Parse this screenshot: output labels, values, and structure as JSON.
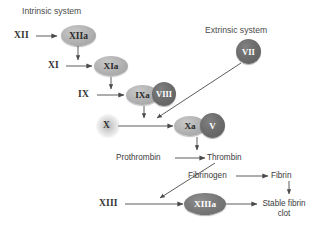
{
  "diagram": {
    "title_intrinsic": "Intrinsic system",
    "title_extrinsic": "Extrinsic system",
    "colors": {
      "node_light": "#b4b4b4",
      "node_dark": "#6d6d6d",
      "node_mid": "#7a7a7a",
      "text": "#3b3b3b",
      "arrow": "#4a4a4a",
      "background": "#ffffff"
    }
  },
  "factors": {
    "xii": "XII",
    "xiia": "XIIa",
    "xi": "XI",
    "xia": "XIa",
    "ix": "IX",
    "ixa": "IXa",
    "viii": "VIII",
    "x": "X",
    "xa": "Xa",
    "v": "V",
    "vii": "VII",
    "xiii": "XIII",
    "xiiia": "XIIIa"
  },
  "proteins": {
    "prothrombin": "Prothrombin",
    "thrombin": "Thrombin",
    "fibrinogen": "Fibrinogen",
    "fibrin": "Fibrin",
    "stable_fibrin_clot_line1": "Stable fibrin",
    "stable_fibrin_clot_line2": "clot"
  },
  "edges": [
    {
      "name": "xii-to-xiia",
      "from": "XII",
      "to": "XIIa",
      "style": "straight-horizontal"
    },
    {
      "name": "xiia-to-xi",
      "from": "XIIa",
      "to": "XI",
      "style": "vertical-down"
    },
    {
      "name": "xi-to-xia",
      "from": "XI",
      "to": "XIa",
      "style": "straight-horizontal"
    },
    {
      "name": "xia-to-ix",
      "from": "XIa",
      "to": "IX",
      "style": "vertical-down"
    },
    {
      "name": "ix-to-ixa",
      "from": "IX",
      "to": "IXa",
      "style": "straight-horizontal"
    },
    {
      "name": "ixa-viii-to-x",
      "from": "IXa-VIII",
      "to": "X",
      "style": "vertical-down"
    },
    {
      "name": "x-to-xa",
      "from": "X",
      "to": "Xa",
      "style": "straight-horizontal"
    },
    {
      "name": "vii-to-xa",
      "from": "VII",
      "to": "Xa",
      "style": "diagonal"
    },
    {
      "name": "xa-v-to-prothrombin-arrow",
      "from": "Xa-V",
      "to": "prothrombin-thrombin",
      "style": "vertical-down"
    },
    {
      "name": "prothrombin-to-thrombin",
      "from": "Prothrombin",
      "to": "Thrombin",
      "style": "straight-horizontal"
    },
    {
      "name": "thrombin-to-fibrinogen-xiii",
      "from": "Thrombin",
      "to": "XIII-branch",
      "style": "diagonal"
    },
    {
      "name": "fibrinogen-to-fibrin",
      "from": "Fibrinogen",
      "to": "Fibrin",
      "style": "straight-horizontal"
    },
    {
      "name": "fibrin-to-clot",
      "from": "Fibrin",
      "to": "Stable fibrin clot",
      "style": "vertical-down"
    },
    {
      "name": "xiii-to-xiiia",
      "from": "XIII",
      "to": "XIIIa",
      "style": "straight-horizontal"
    },
    {
      "name": "xiiia-to-clot",
      "from": "XIIIa",
      "to": "Stable fibrin clot",
      "style": "straight-horizontal"
    }
  ]
}
